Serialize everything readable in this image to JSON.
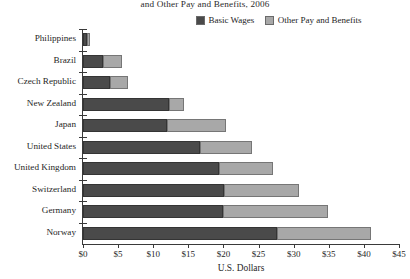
{
  "chart_data": {
    "type": "bar",
    "orientation": "horizontal",
    "stacked": true,
    "title": "and Other Pay and Benefits, 2006",
    "xlabel": "U.S. Dollars",
    "ylabel": "",
    "xlim": [
      0,
      45
    ],
    "xticks": [
      0,
      5,
      10,
      15,
      20,
      25,
      30,
      35,
      40,
      45
    ],
    "xtick_labels": [
      "$0",
      "$5",
      "$10",
      "$15",
      "$20",
      "$25",
      "$30",
      "$35",
      "$40",
      "$45"
    ],
    "grid": false,
    "legend_position": "top-right",
    "categories": [
      "Philippines",
      "Brazil",
      "Czech Republic",
      "New Zealand",
      "Japan",
      "United States",
      "United Kingdom",
      "Switzerland",
      "Germany",
      "Norway"
    ],
    "series": [
      {
        "name": "Basic Wages",
        "color": "#4a4a4a",
        "values": [
          0.6,
          2.9,
          3.9,
          12.2,
          12.0,
          16.7,
          19.3,
          20.1,
          19.9,
          27.6
        ]
      },
      {
        "name": "Other Pay and Benefits",
        "color": "#a8a8a8",
        "values": [
          0.4,
          2.7,
          2.5,
          2.2,
          8.3,
          7.4,
          7.8,
          10.6,
          15.0,
          13.4
        ]
      }
    ],
    "totals": [
      1.0,
      5.6,
      6.4,
      14.4,
      20.3,
      24.1,
      27.1,
      30.7,
      34.9,
      41.0
    ]
  }
}
